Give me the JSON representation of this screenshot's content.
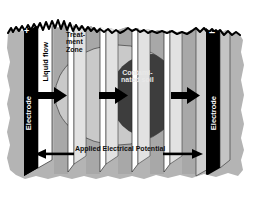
{
  "figure": {
    "type": "electrokinetic-soil-remediation-diagram"
  },
  "labels": {
    "electrode_left": "Electrode",
    "electrode_right": "Electrode",
    "anode_sign": "+",
    "cathode_sign": "–",
    "liquid_flow": "Liquid flow",
    "treatment_zone": "Treat-\nment\nZone",
    "contaminated_soil": "Contami-\nnated soil",
    "applied_potential": "Applied Electrical Potential"
  },
  "icons": {
    "flow_arrow_1": "arrow-right-icon",
    "flow_arrow_2": "arrow-right-icon",
    "flow_arrow_3": "arrow-right-icon",
    "potential_arrow_left": "arrow-left-icon",
    "potential_arrow_right": "arrow-right-icon",
    "ground_surface": "jagged-ground-line-icon"
  },
  "colors": {
    "soil": "#b4b4b4",
    "soil_dark": "#a0a0a0",
    "treatment_zone_fill": "#c9c9c9",
    "contaminated_fill": "#3d3d3d",
    "electrode": "#000000",
    "panel_white": "#ffffff",
    "panel_gray": "#c0c0c0",
    "background": "#ffffff",
    "arrow": "#000000"
  }
}
